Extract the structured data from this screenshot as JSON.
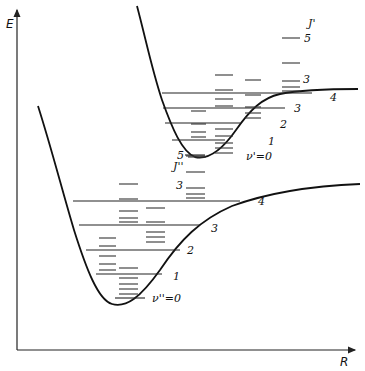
{
  "axes": {
    "y_label": "E",
    "x_label": "R"
  },
  "upper_state": {
    "name": "excited electronic state",
    "vibrational_labels": [
      "ν'=0",
      "1",
      "2",
      "3",
      "4"
    ],
    "rotational_ladder_label": "J'",
    "rotational_marks": [
      "3",
      "5"
    ]
  },
  "lower_state": {
    "name": "ground electronic state",
    "vibrational_labels": [
      "ν''=0",
      "1",
      "2",
      "3",
      "4"
    ],
    "rotational_ladder_label": "J''",
    "rotational_marks": [
      "3",
      "5"
    ]
  },
  "colors": {
    "ink": "#111111",
    "background": "#ffffff"
  }
}
